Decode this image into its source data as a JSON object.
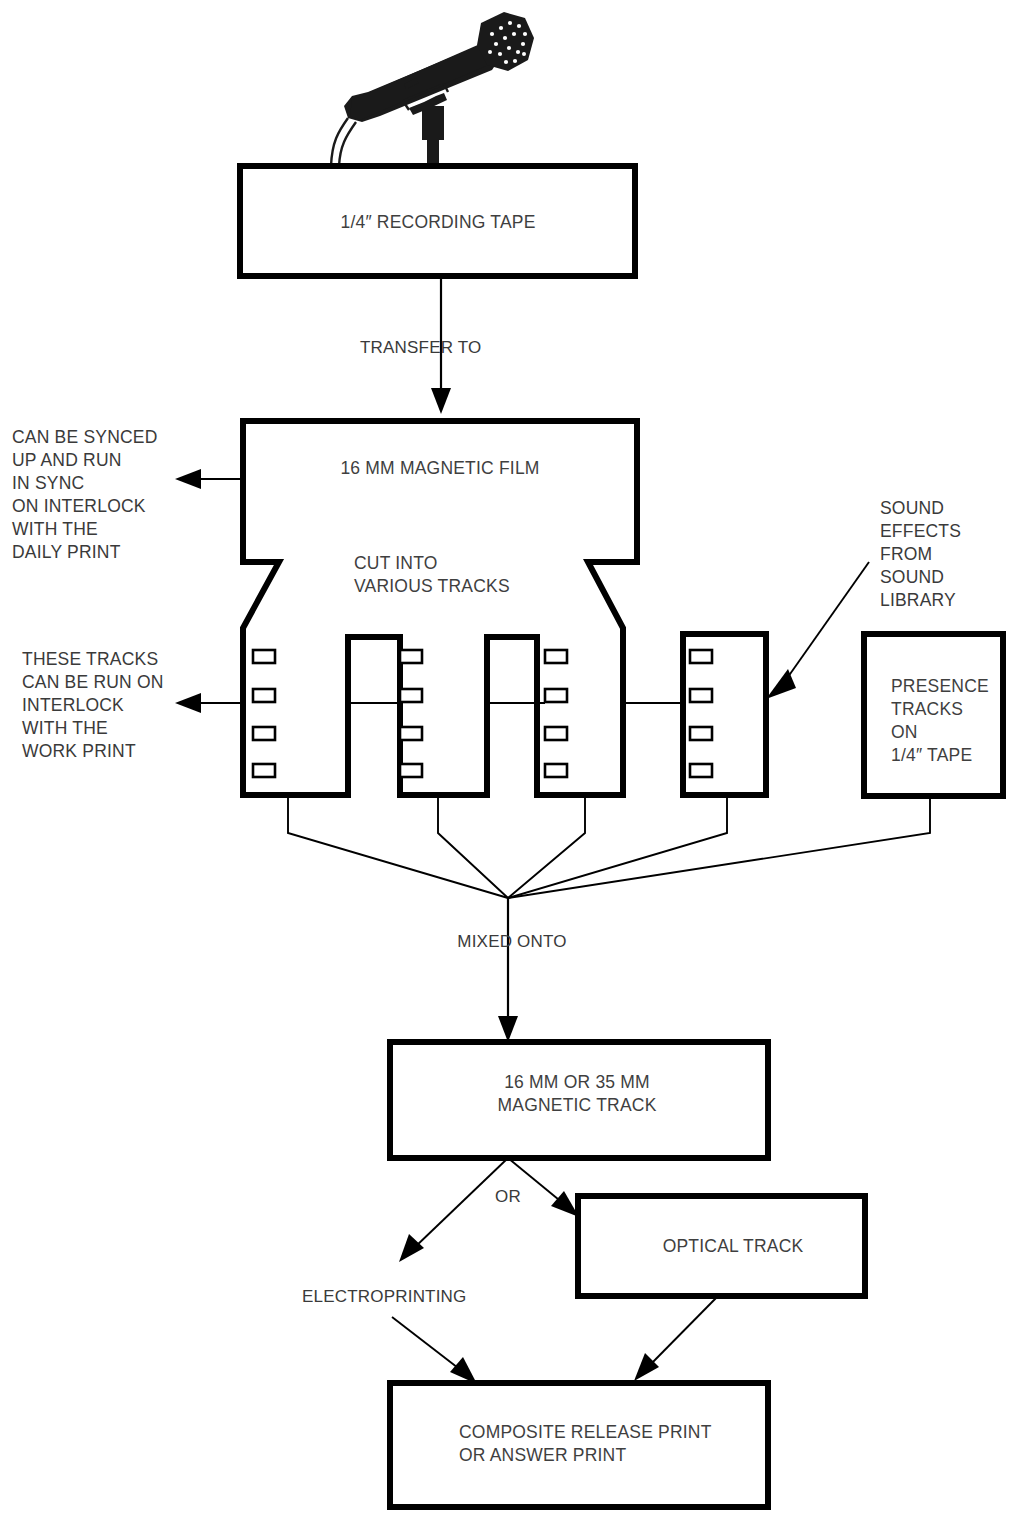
{
  "diagram": {
    "style": {
      "background": "#ffffff",
      "line_color": "#000000",
      "text_color": "#3a3a3a",
      "mic_color": "#1a1a1a"
    },
    "icons": {
      "microphone": "microphone-icon",
      "sprocket_hole": "sprocket-hole-icon"
    },
    "nodes": {
      "recording_tape": {
        "label": "1/4″ RECORDING TAPE"
      },
      "magnetic_film": {
        "label": "16 MM MAGNETIC FILM",
        "sub_label_line1": "CUT INTO",
        "sub_label_line2": "VARIOUS TRACKS"
      },
      "presence_tracks": {
        "line1": "PRESENCE",
        "line2": "TRACKS",
        "line3": "ON",
        "line4": "1/4″ TAPE"
      },
      "magnetic_track": {
        "line1": "16 MM OR 35 MM",
        "line2": "MAGNETIC TRACK"
      },
      "optical_track": {
        "label": "OPTICAL TRACK"
      },
      "composite_print": {
        "line1": "COMPOSITE RELEASE PRINT",
        "line2": "OR ANSWER PRINT"
      }
    },
    "connector_labels": {
      "transfer_to": "TRANSFER TO",
      "mixed_onto": "MIXED ONTO",
      "or": "OR",
      "electroprinting": "ELECTROPRINTING"
    },
    "annotations": {
      "daily_print": {
        "lines": [
          "CAN BE SYNCED",
          "UP AND RUN",
          "IN SYNC",
          "ON INTERLOCK",
          "WITH THE",
          "DAILY PRINT"
        ]
      },
      "work_print": {
        "lines": [
          "THESE TRACKS",
          "CAN BE RUN ON",
          "INTERLOCK",
          "WITH THE",
          "WORK PRINT"
        ]
      },
      "sound_library": {
        "lines": [
          "SOUND",
          "EFFECTS",
          "FROM",
          "SOUND",
          "LIBRARY"
        ]
      }
    }
  }
}
